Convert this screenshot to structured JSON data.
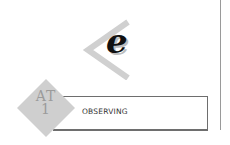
{
  "icon": {
    "letter": "e",
    "chevron": "chevron-left-icon"
  },
  "badge": {
    "line1": "AT",
    "line2": "1",
    "color": "#c8c8c8"
  },
  "label_box": {
    "text": "OBSERVING"
  },
  "colors": {
    "chevron": "#d0d0d0",
    "line": "#9a9a9a",
    "box_border": "#6e6e6e"
  }
}
